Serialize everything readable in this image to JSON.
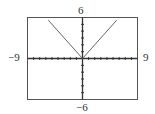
{
  "chart_data": {
    "type": "line",
    "title": "",
    "xlabel": "",
    "ylabel": "",
    "xlim": [
      -9,
      9
    ],
    "ylim": [
      -6,
      6
    ],
    "xscale_ticks": 1,
    "yscale_ticks": 1,
    "grid": false,
    "series": [
      {
        "name": "y = |x|",
        "x": [
          -5.6,
          0,
          5.6
        ],
        "y": [
          5.6,
          0,
          5.6
        ]
      }
    ],
    "window_labels": {
      "ymax": "6",
      "ymin": "−6",
      "xmin": "−9",
      "xmax": "9"
    }
  },
  "colors": {
    "frame": "#555555",
    "axes": "#333333",
    "curve": "#666666",
    "text": "#333333"
  }
}
